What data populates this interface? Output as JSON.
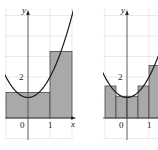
{
  "chart_data": [
    {
      "type": "area",
      "title": "",
      "function": "y = x^2 + 1",
      "xlabel": "x",
      "ylabel": "y",
      "xlim": [
        -1.1,
        2.05
      ],
      "ylim": [
        -0.9,
        5.6
      ],
      "grid": true,
      "tick_labels": {
        "x": [
          "0",
          "1"
        ],
        "y": [
          "2"
        ]
      },
      "rectangles": [
        {
          "x0": -1,
          "x1": 1,
          "height": 1.25
        },
        {
          "x0": 1,
          "x1": 2,
          "height": 3.25
        }
      ]
    },
    {
      "type": "area",
      "title": "",
      "function": "y = x^2 + 1",
      "xlabel": "x",
      "ylabel": "y",
      "xlim": [
        -1.1,
        1.5
      ],
      "ylim": [
        -0.9,
        5.6
      ],
      "grid": true,
      "tick_labels": {
        "x": [
          "0",
          "1"
        ],
        "y": [
          "2"
        ]
      },
      "rectangles": [
        {
          "x0": -1,
          "x1": -0.5,
          "height": 1.5625
        },
        {
          "x0": -0.5,
          "x1": 0,
          "height": 1.0625
        },
        {
          "x0": 0,
          "x1": 0.5,
          "height": 1.0625
        },
        {
          "x0": 0.5,
          "x1": 1,
          "height": 1.5625
        },
        {
          "x0": 1,
          "x1": 1.5,
          "height": 2.5625
        }
      ]
    }
  ]
}
